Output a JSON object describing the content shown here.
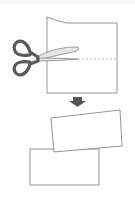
{
  "diagram": {
    "steps": [
      {
        "name": "cut",
        "object": "scissors-cutting-paper",
        "cut_line": "dashed"
      },
      {
        "name": "arrow",
        "direction": "down"
      },
      {
        "name": "result",
        "pieces": 2
      }
    ],
    "colors": {
      "outline": "#7a7a7a",
      "scissors_handle": "#5a5a5a",
      "blade_fill": "#e6e6e6",
      "arrow": "#555555",
      "cut_line": "#b0b0b0",
      "background": "#ffffff"
    }
  }
}
